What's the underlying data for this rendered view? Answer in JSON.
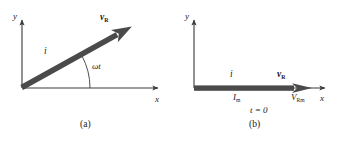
{
  "figure": {
    "type": "phasor-diagram",
    "background_color": "#ffffff",
    "axis_color": "#3a3a3a",
    "phasor_color": "#4a4a4a",
    "text_color": "#1a1a1a"
  },
  "panel_a": {
    "caption": "(a)",
    "axis_x_label": "x",
    "axis_y_label": "y",
    "current_label": "i",
    "voltage_label": "v",
    "voltage_subscript": "R",
    "angle_label": "ωt",
    "phasor_angle_deg": 28,
    "origin": {
      "x": 22,
      "y": 88
    },
    "arrow_tip": {
      "x": 141,
      "y": 22
    },
    "x_axis_end": {
      "x": 160,
      "y": 88
    },
    "y_axis_top": {
      "x": 22,
      "y": 18
    }
  },
  "panel_b": {
    "caption": "(b)",
    "axis_x_label": "x",
    "axis_y_label": "y",
    "current_label": "i",
    "voltage_label": "v",
    "voltage_subscript": "R",
    "current_amplitude_label": "I",
    "current_amplitude_subscript": "m",
    "voltage_amplitude_label": "V",
    "voltage_amplitude_subscript": "Rm",
    "time_label": "t = 0",
    "phasor_angle_deg": 0,
    "origin": {
      "x": 22,
      "y": 88
    },
    "arrow_tip": {
      "x": 140,
      "y": 88
    },
    "x_axis_end": {
      "x": 155,
      "y": 88
    },
    "y_axis_top": {
      "x": 22,
      "y": 18
    }
  }
}
